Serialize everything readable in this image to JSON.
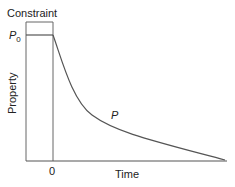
{
  "diagram": {
    "constraint_label": "Constraint",
    "p0_label": "P",
    "p0_subscript": "0",
    "y_axis_label": "Property",
    "x_axis_label": "Time",
    "zero_tick_label": "0",
    "curve_label": "P",
    "colors": {
      "axis": "#555555",
      "curve": "#555555",
      "text": "#222222"
    }
  }
}
